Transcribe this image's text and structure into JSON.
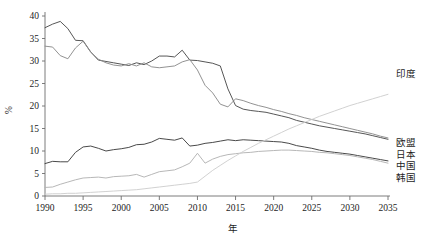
{
  "chart_data": {
    "type": "line",
    "title": "",
    "xlabel": "年",
    "ylabel": "%",
    "xlim": [
      1990,
      2035
    ],
    "ylim": [
      0,
      40
    ],
    "grid": false,
    "legend_position": "right-end-of-line",
    "xticks": [
      1990,
      1995,
      2000,
      2005,
      2010,
      2015,
      2020,
      2025,
      2030,
      2035
    ],
    "yticks": [
      0,
      5,
      10,
      15,
      20,
      25,
      30,
      35,
      40
    ],
    "x": [
      1990,
      1991,
      1992,
      1993,
      1994,
      1995,
      1996,
      1997,
      1998,
      1999,
      2000,
      2001,
      2002,
      2003,
      2004,
      2005,
      2006,
      2007,
      2008,
      2009,
      2010,
      2011,
      2012,
      2013,
      2014,
      2015,
      2016,
      2017,
      2018,
      2019,
      2020,
      2021,
      2022,
      2023,
      2024,
      2025,
      2026,
      2027,
      2028,
      2029,
      2030,
      2031,
      2032,
      2033,
      2034,
      2035
    ],
    "series": [
      {
        "name": "欧盟",
        "color": "#4d4d4d",
        "label": "欧盟",
        "values": [
          37.4,
          38.2,
          38.8,
          37.2,
          34.6,
          34.5,
          32.0,
          30.2,
          29.9,
          29.6,
          29.3,
          29.0,
          29.6,
          29.2,
          30.0,
          31.1,
          31.1,
          30.9,
          32.4,
          30.2,
          30.1,
          29.8,
          29.5,
          28.9,
          23.8,
          20.1,
          19.3,
          19.0,
          18.8,
          18.6,
          18.2,
          17.8,
          17.4,
          16.8,
          16.4,
          16.0,
          15.6,
          15.3,
          15.0,
          14.7,
          14.4,
          14.1,
          13.8,
          13.4,
          13.0,
          12.6
        ]
      },
      {
        "name": "日本",
        "color": "#8c8c8c",
        "label": "日本",
        "values": [
          33.3,
          33.1,
          31.2,
          30.5,
          32.9,
          34.4,
          32.0,
          30.4,
          29.6,
          29.1,
          28.9,
          29.4,
          28.9,
          29.6,
          28.7,
          28.5,
          28.7,
          28.9,
          29.8,
          30.3,
          28.0,
          24.6,
          22.9,
          20.4,
          19.8,
          21.6,
          21.2,
          20.6,
          20.1,
          19.7,
          19.2,
          18.8,
          18.3,
          17.9,
          17.4,
          17.0,
          16.6,
          16.2,
          15.8,
          15.4,
          15.0,
          14.6,
          14.2,
          13.8,
          13.3,
          12.9
        ]
      },
      {
        "name": "中国",
        "color": "#3f3f3f",
        "label": "中国",
        "values": [
          7.2,
          7.7,
          7.6,
          7.6,
          9.7,
          10.9,
          11.1,
          10.6,
          10.0,
          10.3,
          10.5,
          10.8,
          11.4,
          11.5,
          12.0,
          12.8,
          12.6,
          12.4,
          12.9,
          11.1,
          11.3,
          11.7,
          11.9,
          12.2,
          12.5,
          12.3,
          12.5,
          12.4,
          12.3,
          12.2,
          12.1,
          12.0,
          11.7,
          11.2,
          10.9,
          10.6,
          10.2,
          9.9,
          9.7,
          9.5,
          9.3,
          9.0,
          8.7,
          8.4,
          8.1,
          7.8
        ]
      },
      {
        "name": "韩国",
        "color": "#b3b3b3",
        "label": "韩国",
        "values": [
          1.9,
          2.0,
          2.6,
          3.1,
          3.6,
          4.0,
          4.1,
          4.2,
          4.0,
          4.3,
          4.4,
          4.5,
          4.8,
          4.2,
          4.8,
          5.4,
          5.6,
          5.8,
          6.5,
          7.3,
          9.5,
          7.3,
          8.2,
          8.8,
          9.2,
          9.4,
          9.6,
          9.7,
          9.9,
          10.0,
          10.1,
          10.2,
          10.2,
          10.1,
          10.0,
          9.9,
          9.7,
          9.6,
          9.4,
          9.2,
          9.0,
          8.7,
          8.4,
          8.1,
          7.7,
          7.3
        ]
      },
      {
        "name": "印度",
        "color": "#cfcfcf",
        "label": "印度",
        "values": [
          0.4,
          0.5,
          0.5,
          0.6,
          0.6,
          0.7,
          0.8,
          0.9,
          1.0,
          1.1,
          1.2,
          1.3,
          1.4,
          1.6,
          1.8,
          2.0,
          2.2,
          2.4,
          2.6,
          2.8,
          3.1,
          4.4,
          5.7,
          6.8,
          7.9,
          8.9,
          9.9,
          10.8,
          11.7,
          12.5,
          13.3,
          14.1,
          14.9,
          15.6,
          16.3,
          17.0,
          17.7,
          18.3,
          18.9,
          19.5,
          20.1,
          20.6,
          21.1,
          21.6,
          22.1,
          22.6
        ]
      }
    ]
  },
  "labels": {
    "india": "印度",
    "eu": "欧盟",
    "japan": "日本",
    "china": "中国",
    "korea": "韩国",
    "y_axis": "%",
    "x_axis": "年"
  }
}
